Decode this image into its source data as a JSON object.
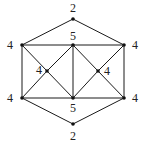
{
  "diagram": {
    "type": "graph",
    "nodes": [
      {
        "id": "top",
        "label": "2",
        "x": 73,
        "y": 19,
        "lx": 73,
        "ly": 8
      },
      {
        "id": "lu",
        "label": "4",
        "x": 22,
        "y": 45,
        "lx": 10,
        "ly": 45
      },
      {
        "id": "uc",
        "label": "5",
        "x": 73,
        "y": 45,
        "lx": 73,
        "ly": 36
      },
      {
        "id": "ru",
        "label": "4",
        "x": 124,
        "y": 45,
        "lx": 135,
        "ly": 45
      },
      {
        "id": "li",
        "label": "4",
        "x": 47,
        "y": 71,
        "lx": 39,
        "ly": 70
      },
      {
        "id": "ri",
        "label": "4",
        "x": 98,
        "y": 71,
        "lx": 107,
        "ly": 71
      },
      {
        "id": "ll",
        "label": "4",
        "x": 22,
        "y": 98,
        "lx": 10,
        "ly": 98
      },
      {
        "id": "lc",
        "label": "5",
        "x": 73,
        "y": 98,
        "lx": 73,
        "ly": 108
      },
      {
        "id": "rl",
        "label": "4",
        "x": 124,
        "y": 98,
        "lx": 135,
        "ly": 98
      },
      {
        "id": "bot",
        "label": "2",
        "x": 73,
        "y": 124,
        "lx": 73,
        "ly": 136
      }
    ],
    "edges": [
      [
        "top",
        "lu"
      ],
      [
        "top",
        "ru"
      ],
      [
        "lu",
        "uc"
      ],
      [
        "uc",
        "ru"
      ],
      [
        "ll",
        "lc"
      ],
      [
        "lc",
        "rl"
      ],
      [
        "lu",
        "ll"
      ],
      [
        "ru",
        "rl"
      ],
      [
        "uc",
        "lc"
      ],
      [
        "lu",
        "li"
      ],
      [
        "li",
        "lc"
      ],
      [
        "ll",
        "li"
      ],
      [
        "li",
        "uc"
      ],
      [
        "uc",
        "ri"
      ],
      [
        "ri",
        "rl"
      ],
      [
        "ru",
        "ri"
      ],
      [
        "ri",
        "lc"
      ],
      [
        "ll",
        "bot"
      ],
      [
        "rl",
        "bot"
      ]
    ],
    "colors": {
      "line": "#1a1a1a",
      "node": "#111111",
      "text": "#222222",
      "background": "#ffffff"
    }
  }
}
